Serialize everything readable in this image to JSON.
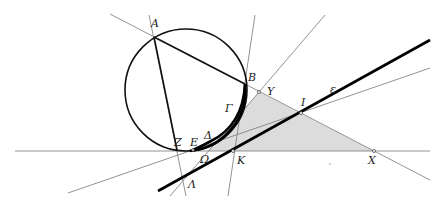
{
  "diagram": {
    "type": "geometry-construction",
    "colors": {
      "shade": "#dcdcdc",
      "thin_line": "#777777",
      "thick_line": "#000000",
      "background": "#ffffff"
    },
    "points": {
      "A": {
        "label": "Α",
        "x": 154,
        "y": 37,
        "lx": 151,
        "ly": 27
      },
      "B": {
        "label": "Β",
        "x": 245,
        "y": 84,
        "lx": 248,
        "ly": 81
      },
      "Gamma": {
        "label": "Γ",
        "x": 239,
        "y": 113,
        "lx": 225,
        "ly": 112
      },
      "Delta": {
        "label": "Δ",
        "x": 211,
        "y": 141,
        "lx": 204,
        "ly": 139
      },
      "E": {
        "label": "Ε",
        "x": 193,
        "y": 150,
        "lx": 190,
        "ly": 146
      },
      "Z": {
        "label": "Ζ",
        "x": 177,
        "y": 150,
        "lx": 174,
        "ly": 146
      },
      "Y": {
        "label": "Υ",
        "x": 259,
        "y": 92,
        "lx": 267,
        "ly": 95
      },
      "I": {
        "label": "Ι",
        "x": 301,
        "y": 113,
        "lx": 301,
        "ly": 106
      },
      "epsilon": {
        "label": "ε",
        "x": 330,
        "y": 90,
        "lx": 330,
        "ly": 93
      },
      "K": {
        "label": "Κ",
        "x": 233,
        "y": 151,
        "lx": 237,
        "ly": 164
      },
      "X": {
        "label": "Χ",
        "x": 374,
        "y": 151,
        "lx": 368,
        "ly": 164
      },
      "Omega": {
        "label": "Ω",
        "x": 208,
        "y": 152,
        "lx": 200,
        "ly": 163
      },
      "Lambda": {
        "label": "Λ",
        "x": 183,
        "y": 181,
        "lx": 188,
        "ly": 188
      }
    },
    "circle": {
      "cx": 186,
      "cy": 90,
      "r": 61
    },
    "shaded_triangle": [
      [
        208,
        151
      ],
      [
        259,
        92
      ],
      [
        374,
        151
      ]
    ],
    "lines": [
      {
        "name": "line-AB-extended",
        "x1": 110,
        "y1": 14,
        "x2": 430,
        "y2": 180,
        "style": "thin"
      },
      {
        "name": "line-AZ-extended",
        "x1": 149,
        "y1": 15,
        "x2": 186,
        "y2": 196,
        "style": "thin"
      },
      {
        "name": "line-B-K",
        "x1": 255,
        "y1": 15,
        "x2": 228,
        "y2": 196,
        "style": "thin"
      },
      {
        "name": "horizontal-line",
        "x1": 15,
        "y1": 151,
        "x2": 430,
        "y2": 151,
        "style": "thin"
      },
      {
        "name": "line-Y-Lambda",
        "x1": 325,
        "y1": 15,
        "x2": 170,
        "y2": 196,
        "style": "thin"
      },
      {
        "name": "line-I-thin",
        "x1": 430,
        "y1": 68,
        "x2": 68,
        "y2": 193,
        "style": "thin"
      },
      {
        "name": "line-epsilon",
        "x1": 430,
        "y1": 40,
        "x2": 158,
        "y2": 191,
        "style": "thick"
      },
      {
        "name": "segment-AB",
        "x1": 154,
        "y1": 37,
        "x2": 245,
        "y2": 84,
        "style": "thick"
      },
      {
        "name": "segment-AZ",
        "x1": 154,
        "y1": 37,
        "x2": 177,
        "y2": 150,
        "style": "thick"
      }
    ],
    "dot": {
      "x": 330,
      "y": 164
    }
  }
}
